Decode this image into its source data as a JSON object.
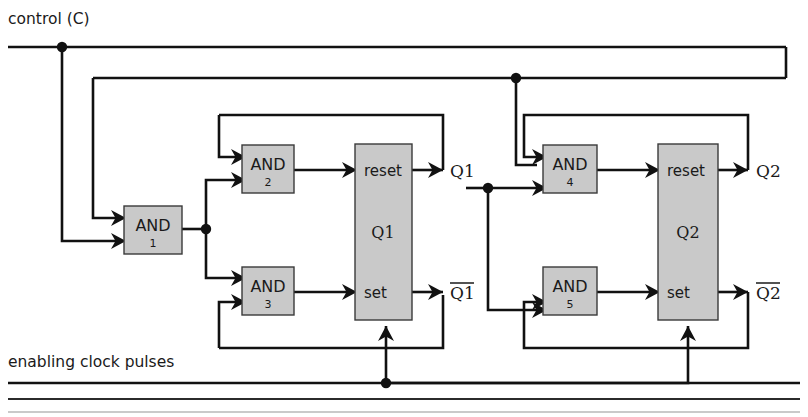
{
  "figure": {
    "type": "logic-circuit-diagram",
    "background_color": "#ffffff",
    "wire_color": "#111111",
    "block_fill_color": "#c9c9c9",
    "block_stroke_color": "#3a3a3a"
  },
  "signals": {
    "control": "control (C)",
    "clock": "enabling clock pulses"
  },
  "gates": [
    {
      "id": "and1",
      "label": "AND",
      "number": "1"
    },
    {
      "id": "and2",
      "label": "AND",
      "number": "2"
    },
    {
      "id": "and3",
      "label": "AND",
      "number": "3"
    },
    {
      "id": "and4",
      "label": "AND",
      "number": "4"
    },
    {
      "id": "and5",
      "label": "AND",
      "number": "5"
    }
  ],
  "flipflops": [
    {
      "id": "ff1",
      "name": "Q1",
      "reset_label": "reset",
      "set_label": "set",
      "out_true": "Q1",
      "out_complement": "Q1",
      "out_complement_barred": true
    },
    {
      "id": "ff2",
      "name": "Q2",
      "reset_label": "reset",
      "set_label": "set",
      "out_true": "Q2",
      "out_complement": "Q2",
      "out_complement_barred": true
    }
  ],
  "outputs": [
    {
      "id": "q1",
      "label": "Q1",
      "barred": false
    },
    {
      "id": "q1bar",
      "label": "Q1",
      "barred": true
    },
    {
      "id": "q2",
      "label": "Q2",
      "barred": false
    },
    {
      "id": "q2bar",
      "label": "Q2",
      "barred": true
    }
  ],
  "junctions": [
    {
      "id": "control-tap",
      "x": 62,
      "y": 47
    },
    {
      "id": "and1-out-tap",
      "x": 206,
      "y": 229
    },
    {
      "id": "q1-feed-tap",
      "x": 488,
      "y": 188
    },
    {
      "id": "control-right-tap",
      "x": 516,
      "y": 78
    },
    {
      "id": "clock-tap",
      "x": 386,
      "y": 383
    }
  ]
}
